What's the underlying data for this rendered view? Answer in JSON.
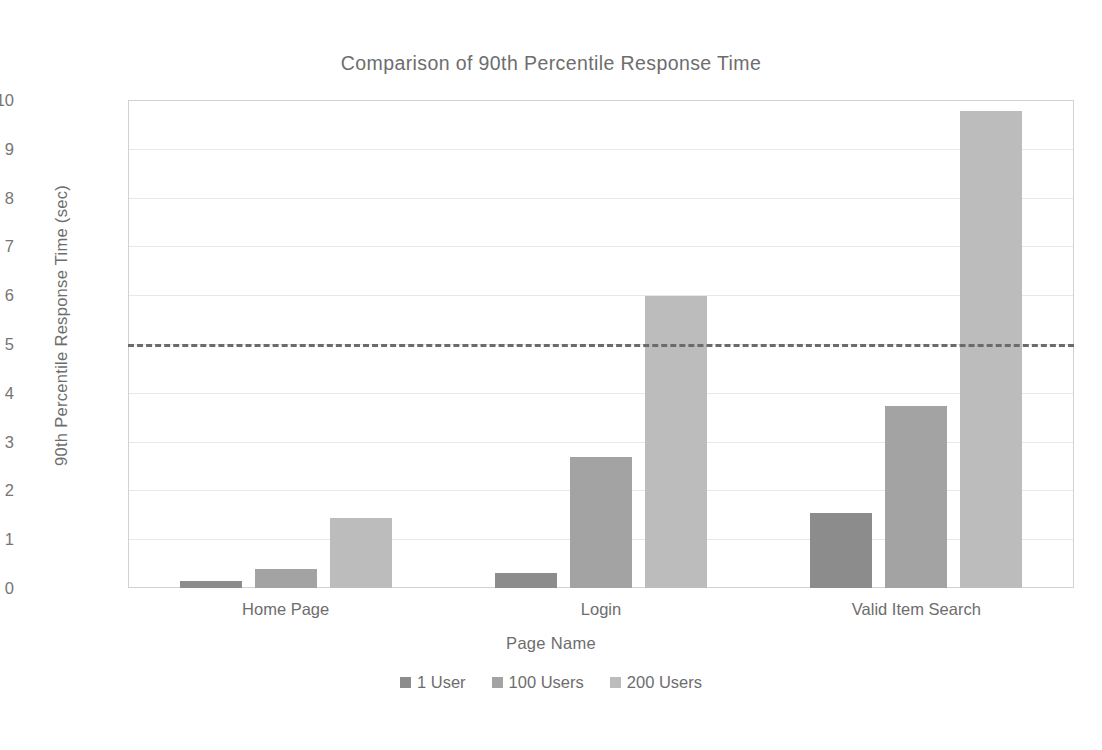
{
  "chart_data": {
    "type": "bar",
    "title": "Comparison of 90th Percentile Response Time",
    "xlabel": "Page Name",
    "ylabel": "90th Percentile Response Time (sec)",
    "categories": [
      "Home Page",
      "Login",
      "Valid Item Search"
    ],
    "series": [
      {
        "name": "1 User",
        "values": [
          0.15,
          0.31,
          1.54
        ],
        "color": "#8c8c8c"
      },
      {
        "name": "100 Users",
        "values": [
          0.38,
          2.68,
          3.72
        ],
        "color": "#a3a3a3"
      },
      {
        "name": "200 Users",
        "values": [
          1.43,
          5.98,
          9.78
        ],
        "color": "#bcbcbc"
      }
    ],
    "ylim": [
      0,
      10
    ],
    "yticks": [
      0,
      1,
      2,
      3,
      4,
      5,
      6,
      7,
      8,
      9,
      10
    ],
    "ytick_labels": [
      "0",
      "1",
      "2",
      "3",
      "4",
      "5",
      "6",
      "7",
      "8",
      "9",
      "10"
    ],
    "grid": true,
    "legend_position": "bottom",
    "annotations": [
      {
        "name": "threshold-line",
        "type": "horizontal-dashed-line",
        "value": 5,
        "color": "#6b6b6b"
      }
    ]
  },
  "legend": {
    "items": [
      {
        "label": "1 User",
        "color": "#8c8c8c"
      },
      {
        "label": "100 Users",
        "color": "#a3a3a3"
      },
      {
        "label": "200 Users",
        "color": "#bcbcbc"
      }
    ]
  }
}
